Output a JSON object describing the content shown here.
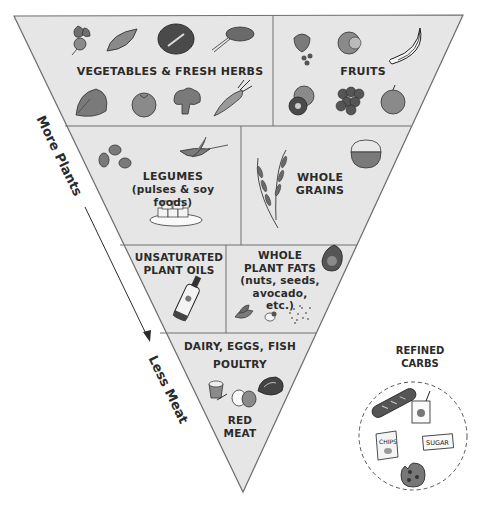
{
  "diagram": {
    "type": "inverted-pyramid",
    "colors": {
      "fill": "#e6e6e6",
      "stroke": "#6e6e6e",
      "icon_fill": "#8a8a8a",
      "icon_dark": "#3a3a3a",
      "text": "#2b2b2b"
    },
    "tiers": [
      {
        "level": 1,
        "sections": [
          {
            "id": "vegetables-herbs",
            "label_lines": [
              "VEGETABLES & FRESH HERBS"
            ],
            "icons": [
              "beet-icon",
              "sweet-potato-icon",
              "red-cabbage-icon",
              "herb-bunch-icon",
              "spinach-icon",
              "tomato-icon",
              "broccoli-icon",
              "carrot-icon"
            ]
          },
          {
            "id": "fruits",
            "label_lines": [
              "FRUITS"
            ],
            "icons": [
              "strawberry-blueberry-icon",
              "grapefruit-icon",
              "banana-icon",
              "kiwi-icon",
              "grapes-icon",
              "apple-icon"
            ]
          }
        ]
      },
      {
        "level": 2,
        "sections": [
          {
            "id": "legumes",
            "label_lines": [
              "LEGUMES",
              "(pulses & soy foods)"
            ],
            "icons": [
              "beans-icon",
              "pea-pod-icon",
              "tofu-plate-icon"
            ]
          },
          {
            "id": "whole-grains",
            "label_lines": [
              "WHOLE",
              "GRAINS"
            ],
            "icons": [
              "wheat-icon",
              "grain-bowl-icon"
            ]
          }
        ]
      },
      {
        "level": 3,
        "sections": [
          {
            "id": "plant-oils",
            "label_lines": [
              "UNSATURATED",
              "PLANT OILS"
            ],
            "icons": [
              "oil-bottle-icon"
            ]
          },
          {
            "id": "plant-fats",
            "label_lines": [
              "WHOLE",
              "PLANT FATS",
              "(nuts, seeds,",
              "avocado, etc.)"
            ],
            "icons": [
              "avocado-icon",
              "leaves-icon",
              "nut-icon",
              "seeds-icon"
            ]
          }
        ]
      },
      {
        "level": 4,
        "sections": [
          {
            "id": "animal-foods",
            "label_lines": [
              "DAIRY, EGGS, FISH",
              "POULTRY",
              "RED",
              "MEAT"
            ],
            "icons": [
              "yogurt-cup-icon",
              "eggs-icon",
              "fish-steak-icon"
            ]
          }
        ]
      }
    ],
    "side_labels": {
      "top": "More Plants",
      "bottom": "Less Meat"
    },
    "refined_carbs": {
      "label_lines": [
        "REFINED",
        "CARBS"
      ],
      "icons": [
        "baguette-icon",
        "juice-box-icon",
        "chips-bag-icon",
        "sugar-packet-icon",
        "cookie-icon"
      ],
      "chips_text": "CHIPS",
      "sugar_text": "SUGAR"
    }
  }
}
